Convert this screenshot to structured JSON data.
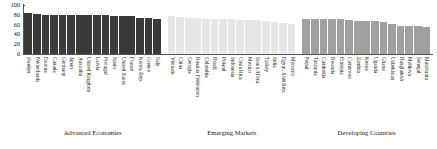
{
  "chart_data": {
    "type": "bar",
    "title": "",
    "subtitle": "",
    "xlabel": "",
    "ylabel": "",
    "ylim": [
      0,
      100
    ],
    "yticks": [
      0,
      20,
      40,
      60,
      80,
      100
    ],
    "grid": false,
    "legend_position": "none",
    "group_label_advanced": "Advanced Economies",
    "group_label_emerging": "Emerging Markets",
    "group_label_developing": "Developing Countries",
    "groups": [
      {
        "name": "Advanced Economies",
        "color": "#3a3a3a",
        "categories": [
          "Sweden",
          "Netherlands",
          "Estonia",
          "Canada",
          "Germany",
          "Japan",
          "Australia",
          "United Kingdom",
          "Latvia",
          "Portugal",
          "Spain",
          "United States",
          "France",
          "Korea, Rep.",
          "Greece",
          "Italy"
        ],
        "values": [
          83,
          82,
          80,
          80,
          80,
          80,
          80,
          80,
          79,
          79,
          78,
          78,
          78,
          74,
          74,
          72
        ]
      },
      {
        "name": "Emerging Markets",
        "color": "#e6e6e6",
        "categories": [
          "Vietnam",
          "China",
          "Georgia",
          "Russian Federation",
          "Colombia",
          "Brazil",
          "Poland",
          "Indonesia",
          "Costa Rica",
          "Mexico",
          "South Africa",
          "Turkey",
          "India",
          "Egypt, Arab Rep.",
          "Morocco"
        ],
        "values": [
          78,
          76,
          74,
          73,
          72,
          72,
          71,
          71,
          70,
          70,
          69,
          67,
          66,
          63,
          62
        ]
      },
      {
        "name": "Developing Countries",
        "color": "#a0a0a0",
        "categories": [
          "Nepal",
          "Tanzania",
          "Cambodia",
          "Rwanda",
          "Ethiopia",
          "Cameroon",
          "Zambia",
          "Kenya",
          "Uganda",
          "Ghana",
          "Uzbekistan",
          "Bangladesh",
          "Moldova",
          "Senegal",
          "Mauritania"
        ],
        "values": [
          72,
          72,
          72,
          72,
          72,
          70,
          68,
          67,
          67,
          66,
          61,
          58,
          58,
          58,
          55
        ]
      }
    ]
  }
}
